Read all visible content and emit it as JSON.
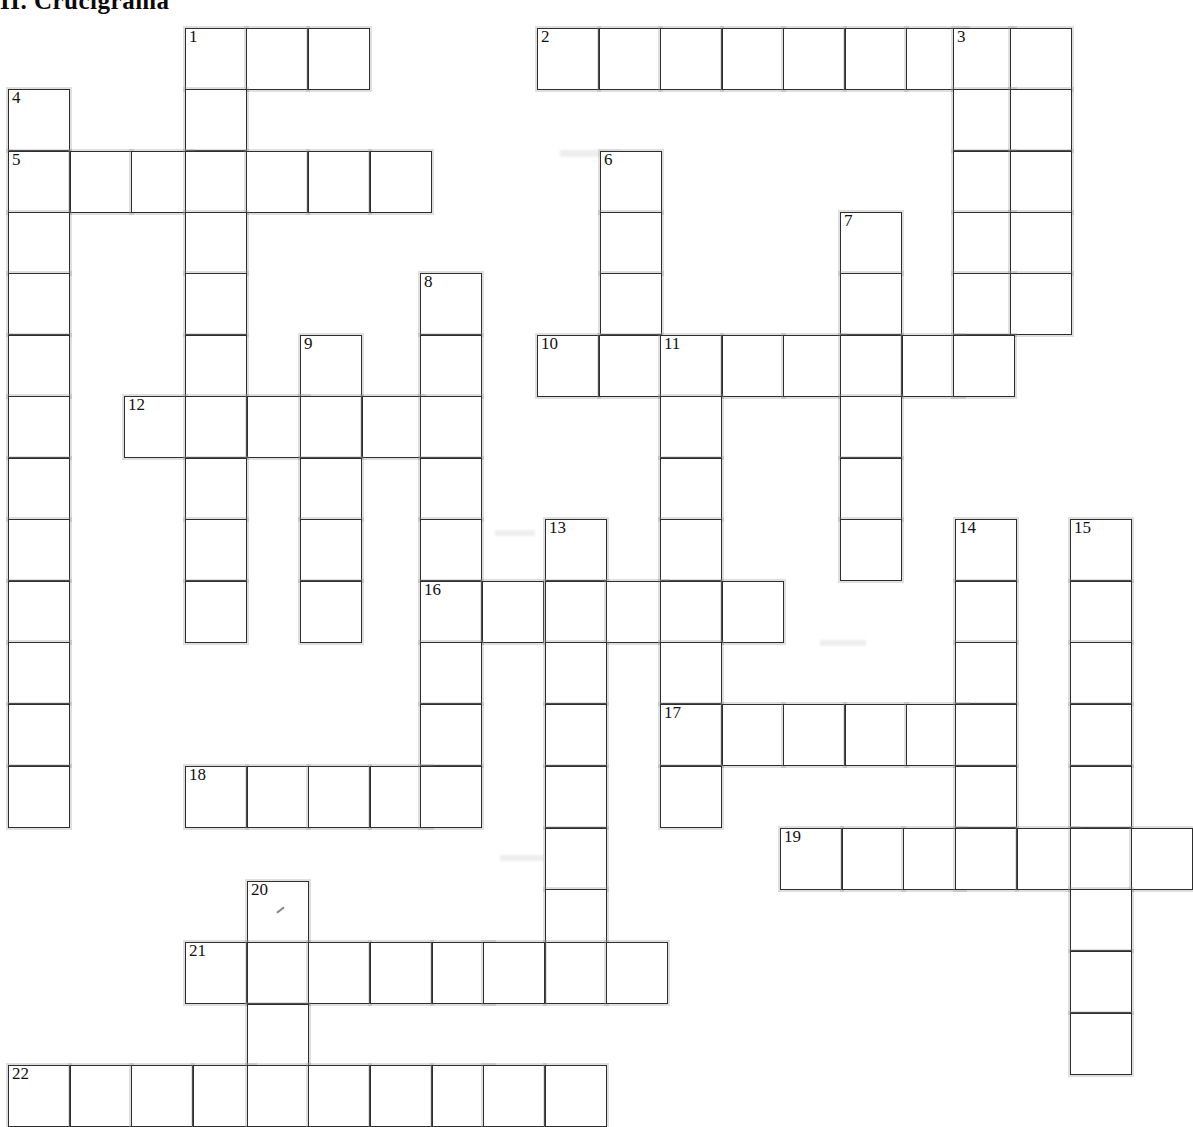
{
  "title": {
    "section_number": "II.",
    "heading": "Crucigrama",
    "full": "II.  Crucigrama"
  },
  "grid": {
    "origin_x": 8,
    "origin_y": 28,
    "cell_size": 61.5,
    "columns": 20,
    "rows": 18,
    "colors": {
      "cell_background": "#ffffff",
      "cell_border": "#2e2e2e",
      "halo": "#969696",
      "number_text": "#111111",
      "page_background": "#ffffff"
    }
  },
  "entries": [
    {
      "number": "1",
      "direction": "across",
      "col": 3,
      "row": 0,
      "length": 3
    },
    {
      "number": "1",
      "direction": "down",
      "col": 3,
      "row": 0,
      "length": 10
    },
    {
      "number": "2",
      "direction": "across",
      "col": 8.6,
      "row": 0,
      "length": 9
    },
    {
      "number": "3",
      "direction": "down",
      "col": 15.6,
      "row": 0,
      "length": 6
    },
    {
      "number": "4",
      "direction": "down",
      "col": 0,
      "row": 1,
      "length": 11
    },
    {
      "number": "5",
      "direction": "across",
      "col": 0,
      "row": 2,
      "length": 7
    },
    {
      "number": "6",
      "direction": "down",
      "col": 9.6,
      "row": 2,
      "length": 4
    },
    {
      "number": "7",
      "direction": "down",
      "col": 13.6,
      "row": 3,
      "length": 6
    },
    {
      "number": "8",
      "direction": "down",
      "col": 6.8,
      "row": 4,
      "length": 9
    },
    {
      "number": "9",
      "direction": "down",
      "col": 4.8,
      "row": 5,
      "length": 5
    },
    {
      "number": "10",
      "direction": "across",
      "col": 8.6,
      "row": 5,
      "length": 8
    },
    {
      "number": "11",
      "direction": "down",
      "col": 10.6,
      "row": 5,
      "length": 8
    },
    {
      "number": "12",
      "direction": "across",
      "col": 2,
      "row": 6,
      "length": 5
    },
    {
      "number": "13",
      "direction": "down",
      "col": 8.8,
      "row": 8,
      "length": 9
    },
    {
      "number": "14",
      "direction": "down",
      "col": 15.4,
      "row": 8,
      "length": 6
    },
    {
      "number": "15",
      "direction": "down",
      "col": 17.3,
      "row": 8,
      "length": 11
    },
    {
      "number": "16",
      "direction": "across",
      "col": 6.8,
      "row": 9,
      "length": 6
    },
    {
      "number": "17",
      "direction": "across",
      "col": 10.6,
      "row": 11,
      "length": 6
    },
    {
      "number": "18",
      "direction": "across",
      "col": 3,
      "row": 12,
      "length": 5
    },
    {
      "number": "19",
      "direction": "across",
      "col": 12.6,
      "row": 13,
      "length": 7
    },
    {
      "number": "20",
      "direction": "down",
      "col": 4,
      "row": 14,
      "length": 4
    },
    {
      "number": "21",
      "direction": "across",
      "col": 3,
      "row": 15,
      "length": 8
    },
    {
      "number": "22",
      "direction": "across",
      "col": 0,
      "row": 17,
      "length": 10
    }
  ],
  "cells": [
    {
      "x": 185,
      "y": 28,
      "num": "1"
    },
    {
      "x": 246,
      "y": 28
    },
    {
      "x": 308,
      "y": 28
    },
    {
      "x": 537,
      "y": 28,
      "num": "2"
    },
    {
      "x": 599,
      "y": 28
    },
    {
      "x": 660,
      "y": 28
    },
    {
      "x": 722,
      "y": 28
    },
    {
      "x": 783,
      "y": 28
    },
    {
      "x": 845,
      "y": 28
    },
    {
      "x": 906,
      "y": 28
    },
    {
      "x": 953,
      "y": 28,
      "num": "3"
    },
    {
      "x": 1010,
      "y": 28
    },
    {
      "x": 185,
      "y": 89
    },
    {
      "x": 8,
      "y": 89,
      "num": "4"
    },
    {
      "x": 953,
      "y": 89
    },
    {
      "x": 1010,
      "y": 89
    },
    {
      "x": 8,
      "y": 151,
      "num": "5"
    },
    {
      "x": 70,
      "y": 151
    },
    {
      "x": 131,
      "y": 151
    },
    {
      "x": 185,
      "y": 151
    },
    {
      "x": 246,
      "y": 151
    },
    {
      "x": 308,
      "y": 151
    },
    {
      "x": 370,
      "y": 151
    },
    {
      "x": 600,
      "y": 151,
      "num": "6"
    },
    {
      "x": 953,
      "y": 151
    },
    {
      "x": 1010,
      "y": 151
    },
    {
      "x": 8,
      "y": 212
    },
    {
      "x": 185,
      "y": 212
    },
    {
      "x": 600,
      "y": 212
    },
    {
      "x": 840,
      "y": 212,
      "num": "7"
    },
    {
      "x": 953,
      "y": 212
    },
    {
      "x": 1010,
      "y": 212
    },
    {
      "x": 8,
      "y": 273
    },
    {
      "x": 185,
      "y": 273
    },
    {
      "x": 420,
      "y": 273,
      "num": "8"
    },
    {
      "x": 600,
      "y": 273
    },
    {
      "x": 840,
      "y": 273
    },
    {
      "x": 953,
      "y": 273
    },
    {
      "x": 1010,
      "y": 273
    },
    {
      "x": 8,
      "y": 335
    },
    {
      "x": 185,
      "y": 335
    },
    {
      "x": 300,
      "y": 335,
      "num": "9"
    },
    {
      "x": 420,
      "y": 335
    },
    {
      "x": 537,
      "y": 335,
      "num": "10"
    },
    {
      "x": 599,
      "y": 335
    },
    {
      "x": 660,
      "y": 335,
      "num": "11"
    },
    {
      "x": 722,
      "y": 335
    },
    {
      "x": 783,
      "y": 335
    },
    {
      "x": 840,
      "y": 335
    },
    {
      "x": 902,
      "y": 335
    },
    {
      "x": 953,
      "y": 335
    },
    {
      "x": 8,
      "y": 396
    },
    {
      "x": 124,
      "y": 396,
      "num": "12"
    },
    {
      "x": 185,
      "y": 396
    },
    {
      "x": 247,
      "y": 396
    },
    {
      "x": 300,
      "y": 396
    },
    {
      "x": 362,
      "y": 396
    },
    {
      "x": 420,
      "y": 396
    },
    {
      "x": 660,
      "y": 396
    },
    {
      "x": 840,
      "y": 396
    },
    {
      "x": 8,
      "y": 458
    },
    {
      "x": 185,
      "y": 458
    },
    {
      "x": 300,
      "y": 458
    },
    {
      "x": 420,
      "y": 458
    },
    {
      "x": 660,
      "y": 458
    },
    {
      "x": 840,
      "y": 458
    },
    {
      "x": 8,
      "y": 519
    },
    {
      "x": 185,
      "y": 519
    },
    {
      "x": 300,
      "y": 519
    },
    {
      "x": 420,
      "y": 519
    },
    {
      "x": 545,
      "y": 519,
      "num": "13"
    },
    {
      "x": 660,
      "y": 519
    },
    {
      "x": 840,
      "y": 519
    },
    {
      "x": 955,
      "y": 519,
      "num": "14"
    },
    {
      "x": 1070,
      "y": 519,
      "num": "15"
    },
    {
      "x": 8,
      "y": 581
    },
    {
      "x": 185,
      "y": 581
    },
    {
      "x": 300,
      "y": 581
    },
    {
      "x": 420,
      "y": 581,
      "num": "16"
    },
    {
      "x": 482,
      "y": 581
    },
    {
      "x": 545,
      "y": 581
    },
    {
      "x": 606,
      "y": 581
    },
    {
      "x": 660,
      "y": 581
    },
    {
      "x": 722,
      "y": 581
    },
    {
      "x": 955,
      "y": 519
    },
    {
      "x": 955,
      "y": 581
    },
    {
      "x": 1070,
      "y": 581
    },
    {
      "x": 8,
      "y": 642
    },
    {
      "x": 420,
      "y": 642
    },
    {
      "x": 545,
      "y": 642
    },
    {
      "x": 660,
      "y": 642
    },
    {
      "x": 955,
      "y": 642
    },
    {
      "x": 1070,
      "y": 642
    },
    {
      "x": 8,
      "y": 704
    },
    {
      "x": 420,
      "y": 704
    },
    {
      "x": 545,
      "y": 704
    },
    {
      "x": 660,
      "y": 704,
      "num": "17"
    },
    {
      "x": 722,
      "y": 704
    },
    {
      "x": 783,
      "y": 704
    },
    {
      "x": 845,
      "y": 704
    },
    {
      "x": 906,
      "y": 704
    },
    {
      "x": 955,
      "y": 704
    },
    {
      "x": 1070,
      "y": 704
    },
    {
      "x": 8,
      "y": 766
    },
    {
      "x": 185,
      "y": 766,
      "num": "18"
    },
    {
      "x": 247,
      "y": 766
    },
    {
      "x": 308,
      "y": 766
    },
    {
      "x": 370,
      "y": 766
    },
    {
      "x": 420,
      "y": 766
    },
    {
      "x": 545,
      "y": 766
    },
    {
      "x": 660,
      "y": 766
    },
    {
      "x": 955,
      "y": 766
    },
    {
      "x": 1070,
      "y": 766
    },
    {
      "x": 545,
      "y": 828
    },
    {
      "x": 780,
      "y": 828,
      "num": "19"
    },
    {
      "x": 842,
      "y": 828
    },
    {
      "x": 903,
      "y": 828
    },
    {
      "x": 955,
      "y": 828
    },
    {
      "x": 1017,
      "y": 828
    },
    {
      "x": 1070,
      "y": 828
    },
    {
      "x": 1131,
      "y": 828
    },
    {
      "x": 545,
      "y": 889
    },
    {
      "x": 1070,
      "y": 889
    },
    {
      "x": 247,
      "y": 881,
      "num": "20",
      "speck": true
    },
    {
      "x": 545,
      "y": 942
    },
    {
      "x": 1070,
      "y": 951
    },
    {
      "x": 185,
      "y": 942,
      "num": "21"
    },
    {
      "x": 247,
      "y": 942
    },
    {
      "x": 308,
      "y": 942
    },
    {
      "x": 370,
      "y": 942
    },
    {
      "x": 432,
      "y": 942
    },
    {
      "x": 483,
      "y": 942
    },
    {
      "x": 545,
      "y": 942
    },
    {
      "x": 606,
      "y": 942
    },
    {
      "x": 247,
      "y": 1004
    },
    {
      "x": 1070,
      "y": 1013
    },
    {
      "x": 8,
      "y": 1065,
      "num": "22"
    },
    {
      "x": 70,
      "y": 1065
    },
    {
      "x": 131,
      "y": 1065
    },
    {
      "x": 193,
      "y": 1065
    },
    {
      "x": 247,
      "y": 1065
    },
    {
      "x": 308,
      "y": 1065
    },
    {
      "x": 370,
      "y": 1065
    },
    {
      "x": 432,
      "y": 1065
    },
    {
      "x": 483,
      "y": 1065
    },
    {
      "x": 545,
      "y": 1065
    }
  ]
}
